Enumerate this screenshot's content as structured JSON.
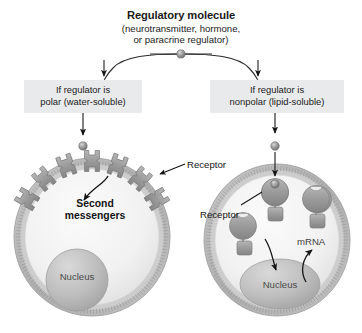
{
  "figure": {
    "title": "Regulatory molecule",
    "subtitle_line1": "(neurotransmitter, hormone,",
    "subtitle_line2": "or paracrine regulator)"
  },
  "branches": {
    "left": {
      "line1": "If regulator is",
      "line2": "polar (water-soluble)"
    },
    "right": {
      "line1": "If regulator is",
      "line2": "nonpolar (lipid-soluble)"
    }
  },
  "left_cell": {
    "receptor_label": "Receptor",
    "second_messengers_line1": "Second",
    "second_messengers_line2": "messengers",
    "nucleus_label": "Nucleus",
    "membrane_receptor_count": 7
  },
  "right_cell": {
    "receptor_label": "Receptor",
    "mrna_label": "mRNA",
    "nucleus_label": "Nucleus",
    "intracellular_receptor_count": 3
  },
  "colors": {
    "background": "#ffffff",
    "text": "#1a1a1a",
    "branch_box_fill": "#e9eaec",
    "membrane_gray": "#a8a8a8",
    "protein_gray": "#9a9a9a",
    "nucleus_gray": "#b4b4b4",
    "cytoplasm": "#f2f2f2",
    "molecule_dot": "#8f8f8f",
    "arrow_stroke": "#141414"
  }
}
